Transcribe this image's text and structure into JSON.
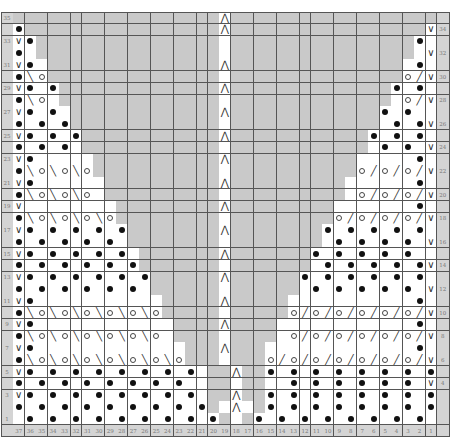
{
  "chart_title": "",
  "geometry": {
    "cell_w": 11.45,
    "cell_h": 11.8,
    "label_w": 12.3,
    "stitches": 37,
    "rows": 35
  },
  "legend_codes": {
    "#": "grey-no-stitch",
    ".": "knit-blank",
    "o": "purl-dot",
    "V": "slip-stitch",
    "\\": "left-lean-decrease",
    "/": "right-lean-decrease",
    "O": "yarn-over",
    "A": "double-decrease"
  },
  "colors": {
    "grey": "#c9c9c9",
    "white": "#ffffff",
    "label": "#d4d4d4",
    "line": "#555555"
  },
  "bottom_labels": [
    "37",
    "36",
    "35",
    "34",
    "33",
    "32",
    "31",
    "30",
    "29",
    "28",
    "27",
    "26",
    "25",
    "24",
    "23",
    "22",
    "21",
    "20",
    "19",
    "18",
    "17",
    "16",
    "15",
    "14",
    "13",
    "12",
    "11",
    "10",
    "9",
    "8",
    "7",
    "6",
    "5",
    "4",
    "3",
    "2",
    "1"
  ],
  "rows": [
    {
      "n": 35,
      "left": "35",
      "right": "",
      "cells": "##################A##################"
    },
    {
      "n": 34,
      "left": "",
      "right": "34",
      "cells": "o#################A#################V"
    },
    {
      "n": 33,
      "left": "33",
      "right": "",
      "cells": "Vo################.################o."
    },
    {
      "n": 32,
      "left": "",
      "right": "32",
      "cells": "o.################.################.V"
    },
    {
      "n": 31,
      "left": "31",
      "right": "",
      "cells": "Vo.###############A###############.o."
    },
    {
      "n": 30,
      "left": "",
      "right": "30",
      "cells": "o\\O###############.###############O/V"
    },
    {
      "n": 29,
      "left": "29",
      "right": "",
      "cells": "Vo.o##############A##############o.o."
    },
    {
      "n": 28,
      "left": "",
      "right": "28",
      "cells": "o\\O.##############.##############.O/V"
    },
    {
      "n": 27,
      "left": "27",
      "right": "",
      "cells": "Vo.o.#############A#############o.o.."
    },
    {
      "n": 26,
      "left": "",
      "right": "26",
      "cells": "o.o.o#############.#############.o.oV"
    },
    {
      "n": 25,
      "left": "25",
      "right": "",
      "cells": "Vo.o.o############A############o.o.o."
    },
    {
      "n": 24,
      "left": "",
      "right": "24",
      "cells": "o.o.o.############.############.o.o.V"
    },
    {
      "n": 23,
      "left": "23",
      "right": "",
      "cells": "Vo.....###########A###########.....o."
    },
    {
      "n": 22,
      "left": "",
      "right": "22",
      "cells": "o\\O\\O\\O###########.###########O/O/O/V"
    },
    {
      "n": 21,
      "left": "21",
      "right": "",
      "cells": "Vo......##########A##########......o."
    },
    {
      "n": 20,
      "left": "",
      "right": "20",
      "cells": "o\\O\\O\\O.##########.##########.O/O/O/V"
    },
    {
      "n": 19,
      "left": "19",
      "right": "",
      "cells": "V........#########A#########.......o."
    },
    {
      "n": 18,
      "left": "",
      "right": "18",
      "cells": "o\\O\\O\\O\\O#########.#########O/O/O/O/V"
    },
    {
      "n": 17,
      "left": "17",
      "right": "",
      "cells": "Vo.o.o.o.o########A########o.o.o.o.o."
    },
    {
      "n": 16,
      "left": "",
      "right": "16",
      "cells": "o.o.o.o.o.########.########.o.o.o.o.V"
    },
    {
      "n": 15,
      "left": "15",
      "right": "",
      "cells": "Vo.o.o.o.o.#######A#######o.o.o.o.o.."
    },
    {
      "n": 14,
      "left": "",
      "right": "14",
      "cells": "o.o.o.o.o.o#######.#######.o.o.o.o.oV"
    },
    {
      "n": 13,
      "left": "13",
      "right": "",
      "cells": "Vo.o.o.o.o.o######A######o.o.o.o.o.o."
    },
    {
      "n": 12,
      "left": "",
      "right": "12",
      "cells": "o.o.o.o.o.o.######.######.o.o.o.o.o.V"
    },
    {
      "n": 11,
      "left": "11",
      "right": "",
      "cells": "Vo...........#####A#####...........o."
    },
    {
      "n": 10,
      "left": "",
      "right": "10",
      "cells": "o\\O\\O\\O\\O\\O\\O#####.#####O/O/O/O/O/O/V"
    },
    {
      "n": 9,
      "left": "9",
      "right": "",
      "cells": "Vo............####A####............o."
    },
    {
      "n": 8,
      "left": "",
      "right": "8",
      "cells": "o\\O\\O\\O\\O\\O\\O.####.####.O/O/O/O/O/O/V"
    },
    {
      "n": 7,
      "left": "7",
      "right": "",
      "cells": "Vo.............###A###.............o."
    },
    {
      "n": 6,
      "left": "",
      "right": "6",
      "cells": "o\\O\\O\\O\\O\\O\\O\\O###.###O/O/O/O/O/O/O/V"
    },
    {
      "n": 5,
      "left": "5",
      "right": "",
      "cells": "Vo.o.o.o.o.o.o.o.##A##o.o.o.o.o.o.o.o."
    },
    {
      "n": 4,
      "left": "",
      "right": "4",
      "cells": "o.o.o.o.o.o.o.o..##.##..o.o.o.o.o.o.V"
    },
    {
      "n": 3,
      "left": "3",
      "right": "",
      "cells": "Vo.o.o.o.o.o.o.o.##A##o.o.o.o.o.o.o.o."
    },
    {
      "n": 2,
      "left": "",
      "right": "",
      "cells": "o.o.o.o.o.o.o.o.o#.A.#o.o.o.o.o.o.o.oV"
    },
    {
      "n": 1,
      "left": "1",
      "right": "",
      "cells": ".o.o.o.o.o.o.o.o.o#.#o.o.o.o.o.o.o.o."
    }
  ]
}
